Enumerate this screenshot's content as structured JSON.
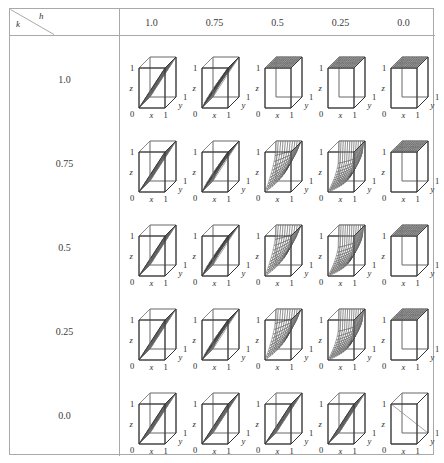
{
  "figure": {
    "type": "table-of-3d-surface-plots",
    "corner_label_row_var": "k",
    "corner_label_col_var": "h",
    "background_color": "#ffffff",
    "frame_color": "#a9a9a9",
    "line_color": "#2f2f2f"
  },
  "columns": {
    "variable": "h",
    "headers": [
      "1.0",
      "0.75",
      "0.5",
      "0.25",
      "0.0"
    ]
  },
  "rows": {
    "variable": "k",
    "headers": [
      "1.0",
      "0.75",
      "0.5",
      "0.25",
      "0.0"
    ]
  },
  "axes": {
    "x_label": "x",
    "y_label": "y",
    "z_label": "z",
    "origin_label": "0",
    "x_max_label": "1",
    "y_max_label": "1",
    "z_max_label": "1"
  },
  "chart_data": {
    "type": "surface-grid",
    "title": "",
    "xlabel": "h",
    "ylabel": "k",
    "grid": true,
    "legend": "none",
    "x": [
      1.0,
      0.75,
      0.5,
      0.25,
      0.0
    ],
    "y": [
      1.0,
      0.75,
      0.5,
      0.25,
      0.0
    ],
    "panel_axes": {
      "x": [
        0,
        1
      ],
      "y": [
        0,
        1
      ],
      "z": [
        0,
        1
      ]
    },
    "panels": [
      {
        "k": 1.0,
        "h": 1.0,
        "surface": "ruled-plane-diagonal",
        "density": "low"
      },
      {
        "k": 1.0,
        "h": 0.75,
        "surface": "curved-diagonal-ramp",
        "density": "medium"
      },
      {
        "k": 1.0,
        "h": 0.5,
        "surface": "flat-top-plane",
        "density": "high"
      },
      {
        "k": 1.0,
        "h": 0.25,
        "surface": "flat-top-plane",
        "density": "high"
      },
      {
        "k": 1.0,
        "h": 0.0,
        "surface": "flat-top-plane",
        "density": "high"
      },
      {
        "k": 0.75,
        "h": 1.0,
        "surface": "ruled-plane-diagonal",
        "density": "low"
      },
      {
        "k": 0.75,
        "h": 0.75,
        "surface": "curved-diagonal-ramp",
        "density": "medium"
      },
      {
        "k": 0.75,
        "h": 0.5,
        "surface": "concave-saddle",
        "density": "medium"
      },
      {
        "k": 0.75,
        "h": 0.25,
        "surface": "concave-saddle-steep",
        "density": "high"
      },
      {
        "k": 0.75,
        "h": 0.0,
        "surface": "flat-top-plane",
        "density": "high"
      },
      {
        "k": 0.5,
        "h": 1.0,
        "surface": "ruled-plane-diagonal",
        "density": "low"
      },
      {
        "k": 0.5,
        "h": 0.75,
        "surface": "curved-diagonal-ramp",
        "density": "medium"
      },
      {
        "k": 0.5,
        "h": 0.5,
        "surface": "concave-saddle",
        "density": "medium"
      },
      {
        "k": 0.5,
        "h": 0.25,
        "surface": "concave-saddle-steep",
        "density": "high"
      },
      {
        "k": 0.5,
        "h": 0.0,
        "surface": "flat-top-plane",
        "density": "high"
      },
      {
        "k": 0.25,
        "h": 1.0,
        "surface": "ruled-plane-diagonal",
        "density": "low"
      },
      {
        "k": 0.25,
        "h": 0.75,
        "surface": "curved-diagonal-ramp",
        "density": "medium"
      },
      {
        "k": 0.25,
        "h": 0.5,
        "surface": "concave-saddle",
        "density": "medium"
      },
      {
        "k": 0.25,
        "h": 0.25,
        "surface": "concave-saddle-steep",
        "density": "high"
      },
      {
        "k": 0.25,
        "h": 0.0,
        "surface": "flat-top-plane",
        "density": "high"
      },
      {
        "k": 0.0,
        "h": 1.0,
        "surface": "ruled-plane-diagonal",
        "density": "low"
      },
      {
        "k": 0.0,
        "h": 0.75,
        "surface": "ruled-plane-diagonal",
        "density": "low"
      },
      {
        "k": 0.0,
        "h": 0.5,
        "surface": "ruled-plane-diagonal",
        "density": "low"
      },
      {
        "k": 0.0,
        "h": 0.25,
        "surface": "ruled-plane-diagonal",
        "density": "low"
      },
      {
        "k": 0.0,
        "h": 0.0,
        "surface": "empty-cube",
        "density": "none"
      }
    ]
  }
}
